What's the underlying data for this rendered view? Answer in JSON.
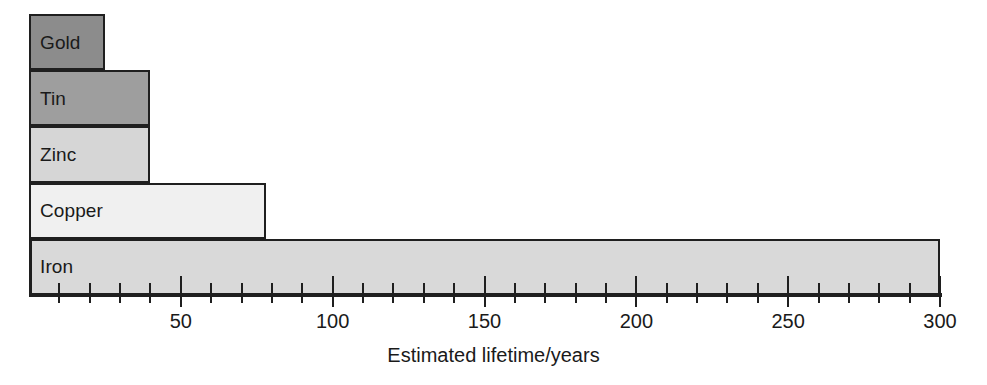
{
  "chart_data": {
    "type": "bar",
    "orientation": "horizontal",
    "title": "",
    "xlabel": "Estimated lifetime/years",
    "ylabel": "",
    "categories": [
      "Gold",
      "Tin",
      "Zinc",
      "Copper",
      "Iron"
    ],
    "values": [
      25,
      40,
      40,
      78,
      300
    ],
    "xlim": [
      0,
      300
    ],
    "xticks": [
      0,
      50,
      100,
      150,
      200,
      250,
      300
    ],
    "xtick_labels": [
      "",
      "50",
      "100",
      "150",
      "200",
      "250",
      "300"
    ],
    "minor_tick_interval": 10,
    "grid": false,
    "legend": null,
    "bar_colors": [
      "#8c8c8c",
      "#9e9e9e",
      "#d6d6d6",
      "#f0f0f0",
      "#d9d9d9"
    ],
    "bar_border_color": "#1f1f1f",
    "series": [
      {
        "name": "Estimated lifetime",
        "points": [
          {
            "label": "Gold",
            "value": 25,
            "color": "#8c8c8c"
          },
          {
            "label": "Tin",
            "value": 40,
            "color": "#9e9e9e"
          },
          {
            "label": "Zinc",
            "value": 40,
            "color": "#d6d6d6"
          },
          {
            "label": "Copper",
            "value": 78,
            "color": "#f0f0f0"
          },
          {
            "label": "Iron",
            "value": 300,
            "color": "#d9d9d9"
          }
        ]
      }
    ]
  }
}
